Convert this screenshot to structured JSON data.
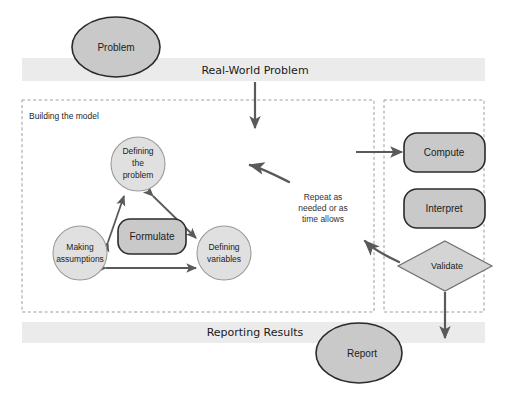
{
  "diagram": {
    "canvas": {
      "width": 521,
      "height": 399,
      "background": "#ffffff"
    },
    "colors": {
      "band_fill": "#ebebeb",
      "shape_dark_fill": "#c9c9c9",
      "shape_light_fill": "#e0e0e0",
      "shape_mid_fill": "#d4d4d4",
      "outline_dark": "#2b2b2b",
      "outline_light": "#9a9a9a",
      "arrow": "#5a5a5a",
      "dashed_border": "#9d9d9d"
    },
    "bands": [
      {
        "id": "real-world-problem",
        "label": "Real-World Problem"
      },
      {
        "id": "reporting-results",
        "label": "Reporting Results"
      }
    ],
    "groups": [
      {
        "id": "building-the-model",
        "label": "Building the model"
      },
      {
        "id": "solving-group",
        "label": ""
      }
    ],
    "nodes": {
      "problem": {
        "label": "Problem",
        "shape": "ellipse"
      },
      "defining_the_problem": {
        "label_lines": [
          "Defining",
          "the",
          "problem"
        ],
        "shape": "circle"
      },
      "formulate": {
        "label": "Formulate",
        "shape": "rounded-rect"
      },
      "making_assumptions": {
        "label_lines": [
          "Making",
          "assumptions"
        ],
        "shape": "circle"
      },
      "defining_variables": {
        "label_lines": [
          "Defining",
          "variables"
        ],
        "shape": "circle"
      },
      "compute": {
        "label": "Compute",
        "shape": "rounded-rect"
      },
      "interpret": {
        "label": "Interpret",
        "shape": "rounded-rect"
      },
      "validate": {
        "label": "Validate",
        "shape": "diamond"
      },
      "report": {
        "label": "Report",
        "shape": "ellipse"
      }
    },
    "annotations": {
      "repeat_note": {
        "lines": [
          "Repeat as",
          "needed or as",
          "time allows"
        ]
      }
    }
  }
}
